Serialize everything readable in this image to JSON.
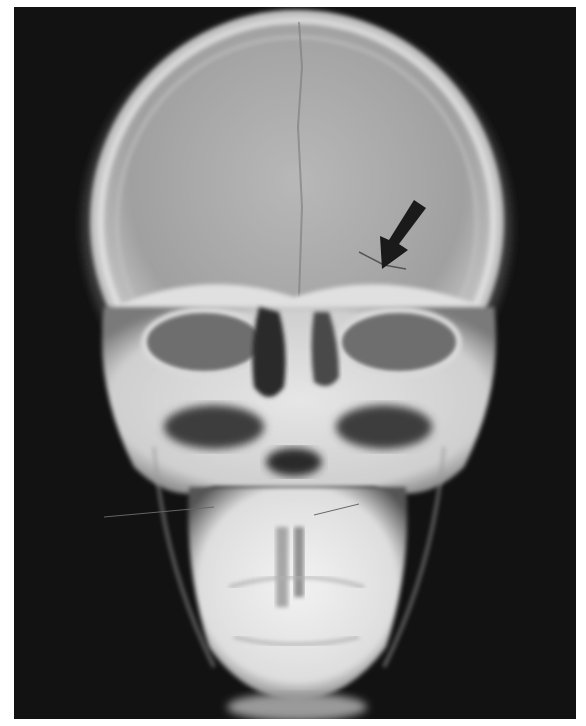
{
  "image": {
    "subject": "frontal skull radiograph",
    "description": "PA X-ray of skull with arrow indicating a fracture line in the right frontal/orbital region",
    "annotation": {
      "type": "arrow",
      "color": "#1a1a1a",
      "direction": "down-left",
      "tip": [
        382,
        262
      ]
    },
    "colors": {
      "background": "#111111",
      "bone": "#e8e8e8",
      "soft": "#8a8a8a",
      "border": "#ffffff"
    }
  }
}
